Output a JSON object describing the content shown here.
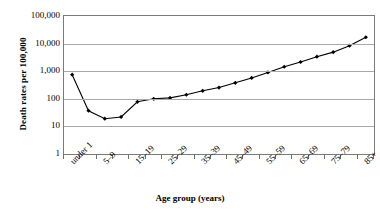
{
  "chart_data": {
    "type": "line",
    "title": "",
    "xlabel": "Age group (years)",
    "ylabel": "Death rates per 100,000",
    "yscale": "log",
    "ylim": [
      1,
      100000
    ],
    "grid": true,
    "legend": "none",
    "ytick_labels": [
      "100,000",
      "10,000",
      "1,000",
      "100",
      "10",
      "1"
    ],
    "ytick_values": [
      100000,
      10000,
      1000,
      100,
      10,
      1
    ],
    "categories": [
      "under 1",
      "1–4",
      "5–9",
      "10–14",
      "15–19",
      "20–24",
      "25–29",
      "30–34",
      "35–39",
      "40–44",
      "45–49",
      "50–54",
      "55–59",
      "60–64",
      "65–69",
      "70–74",
      "75–79",
      "80–84",
      "85+"
    ],
    "xtick_labels_shown": [
      "under 1",
      "5–9",
      "15–19",
      "25–29",
      "35–39",
      "45–49",
      "55–59",
      "65–69",
      "75–79",
      "85+"
    ],
    "values": [
      750,
      37,
      19,
      22,
      78,
      100,
      108,
      140,
      195,
      255,
      380,
      570,
      900,
      1450,
      2150,
      3350,
      4900,
      8400,
      17000
    ],
    "marker": "diamond",
    "line_color": "#000000"
  },
  "axis": {
    "x_title": "Age group (years)",
    "y_title": "Death rates per 100,000"
  }
}
